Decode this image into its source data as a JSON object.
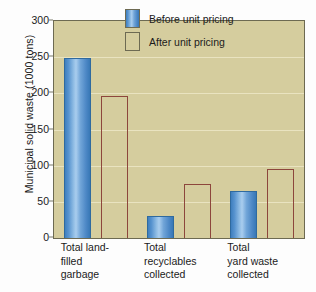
{
  "chart_data": {
    "type": "bar",
    "title": "",
    "subtitle": "",
    "xlabel": "",
    "ylabel": "Municipal solid waste (1000 tons)",
    "ylim": [
      0,
      300
    ],
    "ytick_values": [
      0,
      50,
      100,
      150,
      200,
      250,
      300
    ],
    "ytick_labels": [
      "0",
      "50",
      "100",
      "150",
      "200",
      "250",
      "300"
    ],
    "grid": true,
    "legend_position": "top-right",
    "categories": [
      "Total land-filled garbage",
      "Total recyclables collected",
      "Total yard waste collected"
    ],
    "category_lines": [
      [
        "Total land-",
        "filled",
        "garbage"
      ],
      [
        "Total",
        "recyclables",
        "collected"
      ],
      [
        "Total",
        "yard waste",
        "collected"
      ]
    ],
    "series": [
      {
        "name": "Before unit pricing",
        "color": "#6fa8d8",
        "values": [
          249,
          30,
          65
        ]
      },
      {
        "name": "After unit pricing",
        "color": "#c08377",
        "values": [
          196,
          74,
          95
        ]
      }
    ],
    "plot_background": "#d5cd9e",
    "gridline_color": "#e9e3c0",
    "axis_color": "#6d6a52",
    "page_background": "#fdfdfd"
  },
  "legend": {
    "items": [
      {
        "label": "Before unit pricing"
      },
      {
        "label": "After unit pricing"
      }
    ]
  },
  "axes": {
    "y_title": "Municipal solid waste (1000 tons)"
  }
}
